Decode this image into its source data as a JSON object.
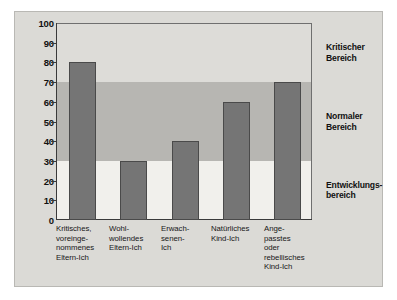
{
  "chart_data": {
    "type": "bar",
    "title": "",
    "xlabel": "",
    "ylabel": "",
    "ylim": [
      0,
      100
    ],
    "grid": false,
    "legend_position": "right",
    "categories": [
      "Kritisches, voreingenommenes Eltern-Ich",
      "Wohlwollendes Eltern-Ich",
      "Erwachsenen-Ich",
      "Natürliches Kind-Ich",
      "Angepasstes oder rebellisches Kind-Ich"
    ],
    "category_lines": [
      [
        "Kritisches,",
        "voreinge-",
        "nommenes",
        "Eltern-Ich"
      ],
      [
        "Wohl-",
        "wollendes",
        "Eltern-Ich"
      ],
      [
        "Erwach-",
        "senen-",
        "Ich"
      ],
      [
        "Natürliches",
        "Kind-Ich"
      ],
      [
        "Ange-",
        "passtes",
        "oder",
        "rebellisches",
        "Kind-Ich"
      ]
    ],
    "values": [
      80,
      30,
      40,
      60,
      70
    ],
    "yticks": [
      100,
      90,
      80,
      70,
      60,
      50,
      40,
      30,
      20,
      10,
      0
    ],
    "bands": [
      {
        "name": "Kritischer Bereich",
        "lines": [
          "Kritischer",
          "Bereich"
        ],
        "from": 70,
        "to": 100,
        "color": "#dddcd8"
      },
      {
        "name": "Normaler Bereich",
        "lines": [
          "Normaler",
          "Bereich"
        ],
        "from": 30,
        "to": 70,
        "color": "#b7b6b2"
      },
      {
        "name": "Entwicklungsbereich",
        "lines": [
          "Entwicklungs-",
          "bereich"
        ],
        "from": 0,
        "to": 30,
        "color": "#f1f0ec"
      }
    ],
    "bar_color": "#757575",
    "panel_color": "#dbdad6",
    "axis_color": "#3a3a3a"
  }
}
